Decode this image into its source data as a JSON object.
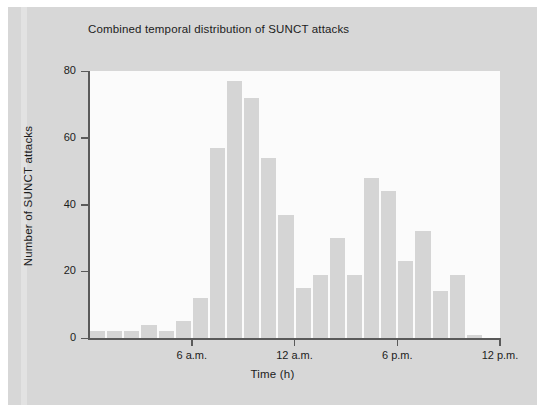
{
  "figure": {
    "background_color": "#ffffff",
    "panel_color": "#d7d7d7",
    "plot_background_color": "#fbfbfb",
    "bar_color": "#d5d5d5",
    "axis_color": "#5a5a5a"
  },
  "chart_data": {
    "type": "bar",
    "title": "Combined temporal distribution of SUNCT attacks",
    "xlabel": "Time (h)",
    "ylabel": "Number of SUNCT attacks",
    "ylim": [
      0,
      80
    ],
    "yticks": [
      0,
      20,
      40,
      60,
      80
    ],
    "ytick_labels": [
      "0",
      "20",
      "40",
      "60",
      "80"
    ],
    "xlim": [
      0,
      24
    ],
    "xticks": [
      6,
      12,
      18,
      24
    ],
    "xtick_labels": [
      "6 a.m.",
      "12 a.m.",
      "6 p.m.",
      "12 p.m."
    ],
    "grid": false,
    "legend": null,
    "categories": [
      "0",
      "1",
      "2",
      "3",
      "4",
      "5",
      "6",
      "7",
      "8",
      "9",
      "10",
      "11",
      "12",
      "13",
      "14",
      "15",
      "16",
      "17",
      "18",
      "19",
      "20",
      "21",
      "22",
      "23"
    ],
    "values": [
      2,
      2,
      2,
      4,
      2,
      5,
      12,
      57,
      77,
      72,
      54,
      37,
      15,
      19,
      30,
      19,
      48,
      44,
      23,
      32,
      14,
      19,
      1,
      0
    ]
  },
  "axes": {
    "y_ticks": [
      {
        "label": "80",
        "value": 80
      },
      {
        "label": "60",
        "value": 60
      },
      {
        "label": "40",
        "value": 40
      },
      {
        "label": "20",
        "value": 20
      },
      {
        "label": "0",
        "value": 0
      }
    ],
    "x_ticks": [
      {
        "label": "6 a.m.",
        "value": 6
      },
      {
        "label": "12 a.m.",
        "value": 12
      },
      {
        "label": "6 p.m.",
        "value": 18
      },
      {
        "label": "12 p.m.",
        "value": 24
      }
    ]
  }
}
